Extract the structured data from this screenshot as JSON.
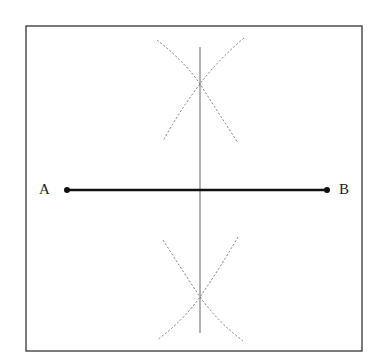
{
  "diagram": {
    "points": {
      "A": {
        "label": "A",
        "x": 67,
        "y": 190
      },
      "B": {
        "label": "B",
        "x": 327,
        "y": 190
      }
    },
    "frame": {
      "x": 26,
      "y": 26,
      "width": 336,
      "height": 325
    },
    "bisector": {
      "x": 200,
      "y1": 47,
      "y2": 333
    },
    "intersections": [
      {
        "x": 200,
        "y": 84
      },
      {
        "x": 200,
        "y": 297
      }
    ],
    "colors": {
      "segment": "#111111",
      "bisector": "#666666",
      "arcs": "#777777",
      "frame": "#333333"
    }
  }
}
